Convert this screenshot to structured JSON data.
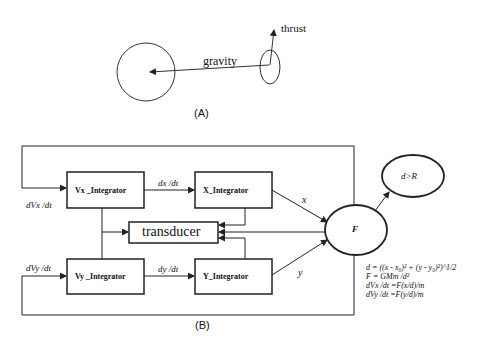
{
  "panel_a": {
    "caption": "(A)",
    "gravity_label": "gravity",
    "thrust_label": "thrust"
  },
  "panel_b": {
    "caption": "(B)",
    "blocks": {
      "vx_integrator": "Vx _Integrator",
      "x_integrator": "X_Integrator",
      "vy_integrator": "Vy _Integrator",
      "y_integrator": "Y_Integrator",
      "transducer": "transducer",
      "force": "F",
      "condition": "d>R"
    },
    "signals": {
      "dx_dt": "dx /dt",
      "dy_dt": "dy /dt",
      "dvx_dt": "dVx /dt",
      "dvy_dt": "dVy /dt",
      "x": "x",
      "y": "y"
    },
    "equations": [
      "d = ((x - x₀)² + (y - y₀)²)^1/2",
      "F =  GMm /d²",
      "dVx /dt  =F(x/d)/m",
      "dVy /dt  =F(y/d)/m"
    ]
  },
  "colors": {
    "line": "#222222",
    "background": "#ffffff"
  }
}
